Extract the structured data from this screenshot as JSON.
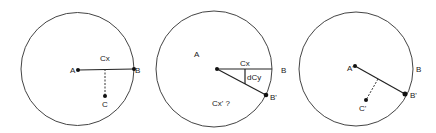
{
  "diagrams": [
    {
      "name": "initial-state",
      "circle": {
        "cx": 77.5,
        "cy": 69,
        "r": 56.5
      },
      "points": {
        "A": {
          "label": "A",
          "x": 78,
          "y": 70
        },
        "B": {
          "label": "B",
          "x": 134,
          "y": 69
        },
        "C": {
          "label": "C",
          "x": 105,
          "y": 96
        }
      },
      "labels": {
        "cx": "Cx"
      }
    },
    {
      "name": "rotation-state",
      "circle": {
        "cx": 214,
        "cy": 69,
        "r": 58
      },
      "points": {
        "A": {
          "label": "A",
          "x": 217,
          "y": 69
        },
        "B": {
          "label": "B",
          "x": 272,
          "y": 69
        },
        "B_prime": {
          "label": "B'",
          "x": 266,
          "y": 95
        }
      },
      "labels": {
        "cx": "Cx",
        "dcy": "dCy",
        "cx_prime": "Cx' ?"
      }
    },
    {
      "name": "final-state",
      "circle": {
        "cx": 356,
        "cy": 69,
        "r": 57
      },
      "points": {
        "A_prime": {
          "label": "A'",
          "x": 355,
          "y": 66
        },
        "B": {
          "label": "B",
          "x": 413,
          "y": 69
        },
        "B_prime": {
          "label": "B'",
          "x": 405,
          "y": 94
        },
        "C_prime": {
          "label": "C'",
          "x": 366,
          "y": 100
        }
      },
      "labels": {}
    }
  ],
  "colors": {
    "stroke": "#444444",
    "dot": "#111111",
    "background": "#ffffff"
  }
}
